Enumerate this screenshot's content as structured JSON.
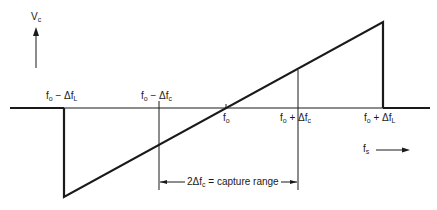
{
  "diagram": {
    "type": "pll-capture-lock-characteristic",
    "y_axis_label": {
      "main": "V",
      "sub": "c"
    },
    "x_axis_label": {
      "main": "f",
      "sub": "s"
    },
    "tick_labels": {
      "lock_low": {
        "main": "f",
        "sub1": "o",
        "op": " − Δf",
        "sub2": "L"
      },
      "capture_low": {
        "main": "f",
        "sub1": "o",
        "op": " − Δf",
        "sub2": "c"
      },
      "center": {
        "main": "f",
        "sub1": "o"
      },
      "capture_high": {
        "main": "f",
        "sub1": "o",
        "op": " + Δf",
        "sub2": "c"
      },
      "lock_high": {
        "main": "f",
        "sub1": "o",
        "op": " + Δf",
        "sub2": "L"
      }
    },
    "capture_range": {
      "prefix": "2Δf",
      "sub": "c",
      "suffix": " = capture range"
    },
    "colors": {
      "line": "#1a1a1a",
      "background": "#ffffff"
    }
  }
}
